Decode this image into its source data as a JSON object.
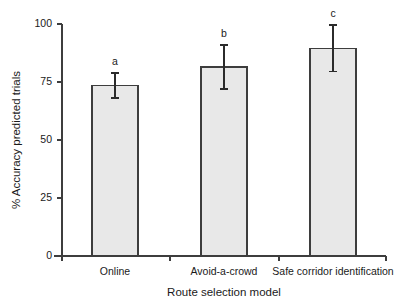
{
  "chart_data": {
    "type": "bar",
    "title": "",
    "xlabel": "Route selection model",
    "ylabel": "% Accuracy predicted trials",
    "categories": [
      "Online",
      "Avoid-a-crowd",
      "Safe corridor identification"
    ],
    "values": [
      73.5,
      81.5,
      89.5
    ],
    "errors": [
      5.5,
      9.5,
      10.0
    ],
    "annotations": [
      "a",
      "b",
      "c"
    ],
    "ylim": [
      0,
      100
    ],
    "yticks": [
      0,
      25,
      50,
      75,
      100
    ],
    "ytick_labels": [
      "0",
      "25",
      "50",
      "75",
      "100"
    ],
    "grid": false,
    "legend": "none",
    "bar_fill": "#e8e8e8",
    "bar_stroke": "#3d3d3d",
    "error_color": "#2b2b2b",
    "axis_color": "#3d3d3d",
    "background": "#ffffff"
  },
  "figure": {
    "caption": ""
  }
}
